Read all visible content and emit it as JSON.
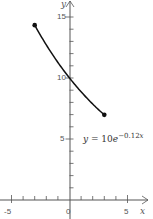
{
  "chart_data": {
    "type": "line",
    "title": "",
    "xlabel": "x",
    "ylabel": "y",
    "xlim": [
      -5.5,
      6
    ],
    "ylim": [
      0,
      16.5
    ],
    "x_ticks": [
      -5,
      -4,
      -3,
      -2,
      -1,
      0,
      1,
      2,
      3,
      4,
      5
    ],
    "x_tick_labels": [
      "-5",
      "0",
      "5"
    ],
    "y_ticks": [
      1,
      2,
      3,
      4,
      5,
      6,
      7,
      8,
      9,
      10,
      11,
      12,
      13,
      14,
      15
    ],
    "y_tick_labels": [
      "5",
      "10",
      "15"
    ],
    "grid": false,
    "series": [
      {
        "name": "y = 10e^{-0.12x}",
        "function": "10*exp(-0.12*x)",
        "domain": [
          -3,
          3
        ],
        "x": [
          -3,
          -2,
          -1,
          0,
          1,
          2,
          3
        ],
        "y": [
          14.33,
          12.71,
          11.27,
          10.0,
          8.87,
          7.87,
          6.98
        ],
        "endpoints": [
          [
            -3,
            14.33
          ],
          [
            3,
            6.98
          ]
        ],
        "endpoint_marker": "filled-dot"
      }
    ],
    "annotations": [
      {
        "text": "y = 10e^{-0.12x}",
        "position": [
          1.5,
          5
        ]
      }
    ]
  },
  "labels": {
    "x_axis": "x",
    "y_axis": "y",
    "x_tick_neg5": "-5",
    "x_tick_0": "0",
    "x_tick_5": "5",
    "y_tick_5": "5",
    "y_tick_10": "10",
    "y_tick_15": "15",
    "eq_y": "y",
    "eq_eq": " = 10",
    "eq_e": "e",
    "eq_exp": "−0.12",
    "eq_x": "x"
  }
}
